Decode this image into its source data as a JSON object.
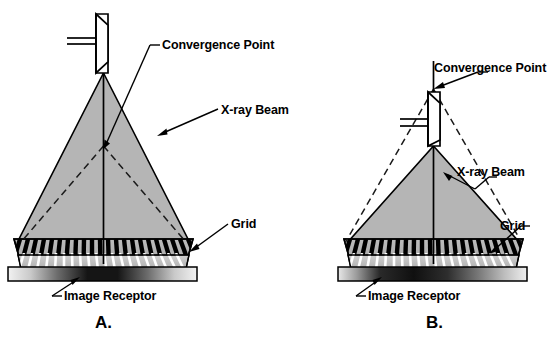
{
  "figure": {
    "title": "",
    "background_color": "#ffffff",
    "beam_fill_color": "#b5b5b5",
    "stroke_color": "#000000",
    "panels": [
      {
        "id": "A",
        "letter": "A.",
        "description": "Grid aligned: tube centered over grid, convergence point on central axis",
        "labels": [
          {
            "name": "convergence-point",
            "text": "Convergence Point"
          },
          {
            "name": "x-ray-beam",
            "text": "X-ray Beam"
          },
          {
            "name": "grid",
            "text": "Grid"
          },
          {
            "name": "image-receptor",
            "text": "Image Receptor"
          }
        ],
        "components": [
          {
            "name": "x-ray-tube",
            "text": ""
          },
          {
            "name": "central-ray",
            "text": ""
          },
          {
            "name": "grid-strips",
            "count": 21
          },
          {
            "name": "receptor-bar",
            "text": ""
          }
        ]
      },
      {
        "id": "B",
        "letter": "B.",
        "description": "Grid off-focus: tube below convergence point, beam diverges past grid strips",
        "labels": [
          {
            "name": "convergence-point",
            "text": "Convergence Point"
          },
          {
            "name": "x-ray-beam",
            "text": "X-ray Beam"
          },
          {
            "name": "grid",
            "text": "Grid"
          },
          {
            "name": "image-receptor",
            "text": "Image Receptor"
          }
        ],
        "components": [
          {
            "name": "x-ray-tube",
            "text": ""
          },
          {
            "name": "central-ray",
            "text": ""
          },
          {
            "name": "grid-strips",
            "count": 21
          },
          {
            "name": "receptor-bar",
            "text": ""
          }
        ]
      }
    ]
  }
}
